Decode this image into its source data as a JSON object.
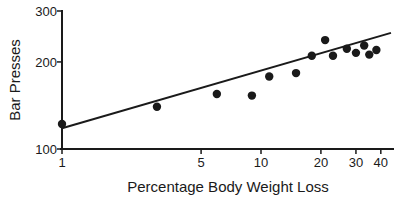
{
  "chart_data": {
    "type": "scatter",
    "title": "",
    "xlabel": "Percentage Body Weight Loss",
    "ylabel": "Bar Presses",
    "xscale": "log",
    "yscale": "log",
    "xlim": [
      1,
      45
    ],
    "ylim": [
      100,
      300
    ],
    "x_ticks": [
      1,
      5,
      10,
      20,
      30,
      40
    ],
    "x_tick_labels": [
      "1",
      "5",
      "10",
      "20",
      "30",
      "40"
    ],
    "y_ticks": [
      100,
      200,
      300
    ],
    "y_tick_labels": [
      "100",
      "200",
      "300"
    ],
    "grid": false,
    "legend": null,
    "series": [
      {
        "name": "observations",
        "points": [
          {
            "x": 1,
            "y": 122
          },
          {
            "x": 3,
            "y": 140
          },
          {
            "x": 6,
            "y": 155
          },
          {
            "x": 9,
            "y": 153
          },
          {
            "x": 11,
            "y": 178
          },
          {
            "x": 15,
            "y": 183
          },
          {
            "x": 18,
            "y": 210
          },
          {
            "x": 21,
            "y": 238
          },
          {
            "x": 23,
            "y": 210
          },
          {
            "x": 27,
            "y": 222
          },
          {
            "x": 30,
            "y": 215
          },
          {
            "x": 33,
            "y": 228
          },
          {
            "x": 35,
            "y": 212
          },
          {
            "x": 38,
            "y": 220
          }
        ]
      },
      {
        "name": "fit line",
        "type": "line",
        "points": [
          {
            "x": 1,
            "y": 118
          },
          {
            "x": 45,
            "y": 252
          }
        ]
      }
    ]
  }
}
